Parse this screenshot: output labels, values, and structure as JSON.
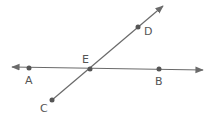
{
  "diagram": {
    "stroke_color": "#6a6a6a",
    "point_color": "#555555",
    "lines": [
      {
        "name": "line-AB",
        "from": [
          12,
          67
        ],
        "to": [
          203,
          70
        ],
        "arrows": "both"
      },
      {
        "name": "ray-CD",
        "from": [
          52,
          100
        ],
        "to": [
          163,
          6
        ],
        "arrows": "end"
      }
    ],
    "points": [
      {
        "label": "A",
        "x": 29,
        "y": 68
      },
      {
        "label": "E",
        "x": 90,
        "y": 69
      },
      {
        "label": "B",
        "x": 159,
        "y": 69
      },
      {
        "label": "C",
        "x": 52,
        "y": 100
      },
      {
        "label": "D",
        "x": 138,
        "y": 27
      }
    ],
    "labels": {
      "A": "A",
      "B": "B",
      "C": "C",
      "D": "D",
      "E": "E"
    }
  }
}
